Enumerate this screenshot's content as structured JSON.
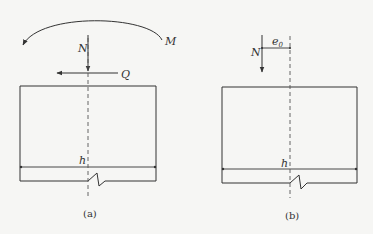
{
  "figure": {
    "panels": [
      {
        "id": "a",
        "caption": "(a)",
        "labels": {
          "axial_force": "N",
          "shear_force": "Q",
          "moment": "M",
          "width": "h"
        }
      },
      {
        "id": "b",
        "caption": "(b)",
        "labels": {
          "axial_force": "N",
          "eccentricity": "e",
          "eccentricity_subscript": "0",
          "width": "h"
        }
      }
    ]
  },
  "colors": {
    "background": "#f6f6f4",
    "line": "#333333"
  }
}
